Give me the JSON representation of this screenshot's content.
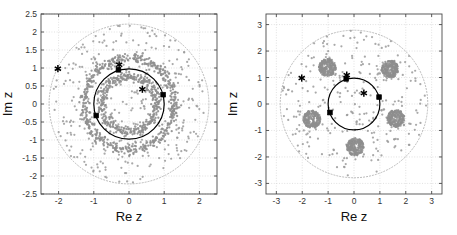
{
  "figure": {
    "title": "",
    "panel_count": 2
  },
  "chart_data": [
    {
      "type": "scatter",
      "panel": "left",
      "title": "",
      "xlabel": "Re z",
      "ylabel": "Im z",
      "xlim": [
        -2.5,
        2.5
      ],
      "ylim": [
        -2.5,
        2.5
      ],
      "xticks": [
        -2,
        -1,
        0,
        1,
        2
      ],
      "xticklabels": [
        "-2",
        "-1",
        "0",
        "1",
        "2"
      ],
      "yticks": [
        -2.5,
        -2,
        -1.5,
        -1,
        -0.5,
        0,
        0.5,
        1,
        1.5,
        2,
        2.5
      ],
      "yticklabels": [
        "-2.5",
        "-2",
        "-1.5",
        "-1",
        "-0.5",
        "0",
        "0.5",
        "1",
        "1.5",
        "2",
        "2.5"
      ],
      "grid": true,
      "grid_style": "dotted",
      "legend": "none",
      "series": [
        {
          "name": "unit-circle",
          "role": "solid-black-circle",
          "shape": "circle",
          "center": [
            0,
            0
          ],
          "radius": 1.0,
          "color": "#000000",
          "linewidth": 1.2,
          "linestyle": "solid"
        },
        {
          "name": "outer-boundary-circle",
          "role": "dotted-gray-circle",
          "shape": "circle",
          "center": [
            0,
            0
          ],
          "radius": 2.27,
          "color": "#b9b9b9",
          "linewidth": 1.0,
          "linestyle": "dotted"
        },
        {
          "name": "eigenvalue-ring-inner",
          "role": "dense-scatter-ring",
          "shape": "annulus-cloud",
          "center": [
            0,
            0
          ],
          "radius": 0.78,
          "thickness": 0.07,
          "color": "#8e8e8e",
          "point_count": 420
        },
        {
          "name": "eigenvalue-ring-outer",
          "role": "dense-scatter-ring",
          "shape": "annulus-cloud",
          "center": [
            0,
            0
          ],
          "radius": 1.28,
          "thickness": 0.07,
          "color": "#8e8e8e",
          "point_count": 520
        },
        {
          "name": "background-scatter",
          "role": "diffuse-scatter",
          "shape": "disk-cloud",
          "center": [
            0,
            0
          ],
          "radius": 2.2,
          "color": "#9a9a9a",
          "point_count": 360,
          "marker": "dot",
          "marker_size": 1.8
        },
        {
          "name": "asterisk-markers",
          "role": "special-points",
          "marker": "asterisk",
          "color": "#000000",
          "points": [
            [
              -2.02,
              0.98
            ],
            [
              -0.28,
              1.09
            ],
            [
              0.38,
              0.41
            ]
          ]
        },
        {
          "name": "square-markers",
          "role": "circle-nodes",
          "marker": "square",
          "color": "#000000",
          "points": [
            [
              -0.3,
              0.95
            ],
            [
              0.97,
              0.26
            ],
            [
              -0.93,
              -0.32
            ]
          ]
        }
      ]
    },
    {
      "type": "scatter",
      "panel": "right",
      "title": "",
      "xlabel": "Re z",
      "ylabel": "Im z",
      "xlim": [
        -3.4,
        3.4
      ],
      "ylim": [
        -3.4,
        3.4
      ],
      "xticks": [
        -3,
        -2,
        -1,
        0,
        1,
        2,
        3
      ],
      "xticklabels": [
        "-3",
        "-2",
        "-1",
        "0",
        "1",
        "2",
        "3"
      ],
      "yticks": [
        -3,
        -2,
        -1,
        0,
        1,
        2,
        3
      ],
      "yticklabels": [
        "-3",
        "-2",
        "-1",
        "0",
        "1",
        "2",
        "3"
      ],
      "grid": true,
      "grid_style": "dotted",
      "legend": "none",
      "series": [
        {
          "name": "unit-circle",
          "role": "solid-black-circle",
          "shape": "circle",
          "center": [
            0,
            0
          ],
          "radius": 1.0,
          "color": "#000000",
          "linewidth": 1.2,
          "linestyle": "solid"
        },
        {
          "name": "outer-boundary-circle",
          "role": "dotted-gray-circle",
          "shape": "circle",
          "center": [
            0,
            0
          ],
          "radius": 2.85,
          "color": "#b9b9b9",
          "linewidth": 1.0,
          "linestyle": "dotted"
        },
        {
          "name": "eigenvalue-blobs",
          "role": "dense-scatter-blobs",
          "shape": "blob-cloud",
          "color": "#8e8e8e",
          "blob_radius": 0.33,
          "points_per_blob": 200,
          "centers": [
            [
              -1.02,
              1.38
            ],
            [
              1.38,
              1.32
            ],
            [
              1.62,
              -0.55
            ],
            [
              0.05,
              -1.62
            ],
            [
              -1.62,
              -0.58
            ]
          ]
        },
        {
          "name": "background-scatter",
          "role": "diffuse-scatter",
          "shape": "disk-cloud",
          "center": [
            0,
            0
          ],
          "radius": 2.8,
          "color": "#9a9a9a",
          "point_count": 300,
          "marker": "dot",
          "marker_size": 1.8
        },
        {
          "name": "asterisk-markers",
          "role": "special-points",
          "marker": "asterisk",
          "color": "#000000",
          "points": [
            [
              -2.02,
              0.98
            ],
            [
              -0.28,
              1.09
            ],
            [
              0.38,
              0.41
            ]
          ]
        },
        {
          "name": "square-markers",
          "role": "circle-nodes",
          "marker": "square",
          "color": "#000000",
          "points": [
            [
              -0.3,
              0.95
            ],
            [
              0.97,
              0.26
            ],
            [
              -0.93,
              -0.32
            ]
          ]
        }
      ]
    }
  ],
  "panels": {
    "left": {
      "name": "left-panel",
      "xlabel": "Re z",
      "ylabel": "Im z"
    },
    "right": {
      "name": "right-panel",
      "xlabel": "Re z",
      "ylabel": "Im z"
    }
  }
}
